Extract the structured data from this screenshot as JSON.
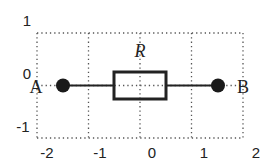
{
  "diagram": {
    "type": "circuit-element-on-grid",
    "grid": {
      "x_ticks": [
        "-2",
        "-1",
        "0",
        "1",
        "2"
      ],
      "y_ticks": [
        "1",
        "0",
        "-1"
      ],
      "xlim": [
        -2,
        2
      ],
      "ylim": [
        -1,
        1
      ],
      "style": "dotted"
    },
    "nodes": [
      {
        "id": "A",
        "label": "A",
        "x": -1.75,
        "y": 0
      },
      {
        "id": "B",
        "label": "B",
        "x": 1.25,
        "y": 0
      }
    ],
    "resistor": {
      "label": "R",
      "x_from": -0.5,
      "x_to": 0.5,
      "y_from": -0.25,
      "y_to": 0.25
    },
    "colors": {
      "stroke": "#222222",
      "grid": "#555555",
      "background": "#ffffff"
    }
  }
}
